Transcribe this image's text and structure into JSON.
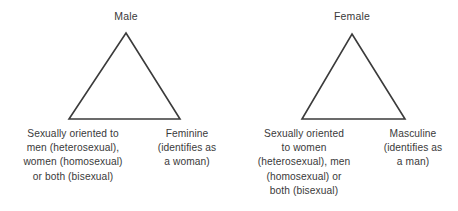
{
  "diagram": {
    "line_color": "#3b3b3b",
    "text_color": "#3a3a3a",
    "background_color": "#ffffff",
    "triangles": [
      {
        "id": "male-triangle",
        "apex_label": "Male",
        "orientation_corner": {
          "name": "sexual-orientation",
          "lines": [
            "Sexually oriented to",
            "men (heterosexual),",
            "women (homosexual)",
            "or both (bisexual)"
          ]
        },
        "gender_corner": {
          "name": "gender-identity",
          "lines": [
            "Feminine",
            "(identifies as",
            "a woman)"
          ]
        }
      },
      {
        "id": "female-triangle",
        "apex_label": "Female",
        "orientation_corner": {
          "name": "sexual-orientation",
          "lines": [
            "Sexually oriented",
            "to women",
            "(heterosexual), men",
            "(homosexual) or",
            "both (bisexual)"
          ]
        },
        "gender_corner": {
          "name": "gender-identity",
          "lines": [
            "Masculine",
            "(identifies as",
            "a man)"
          ]
        }
      }
    ]
  }
}
